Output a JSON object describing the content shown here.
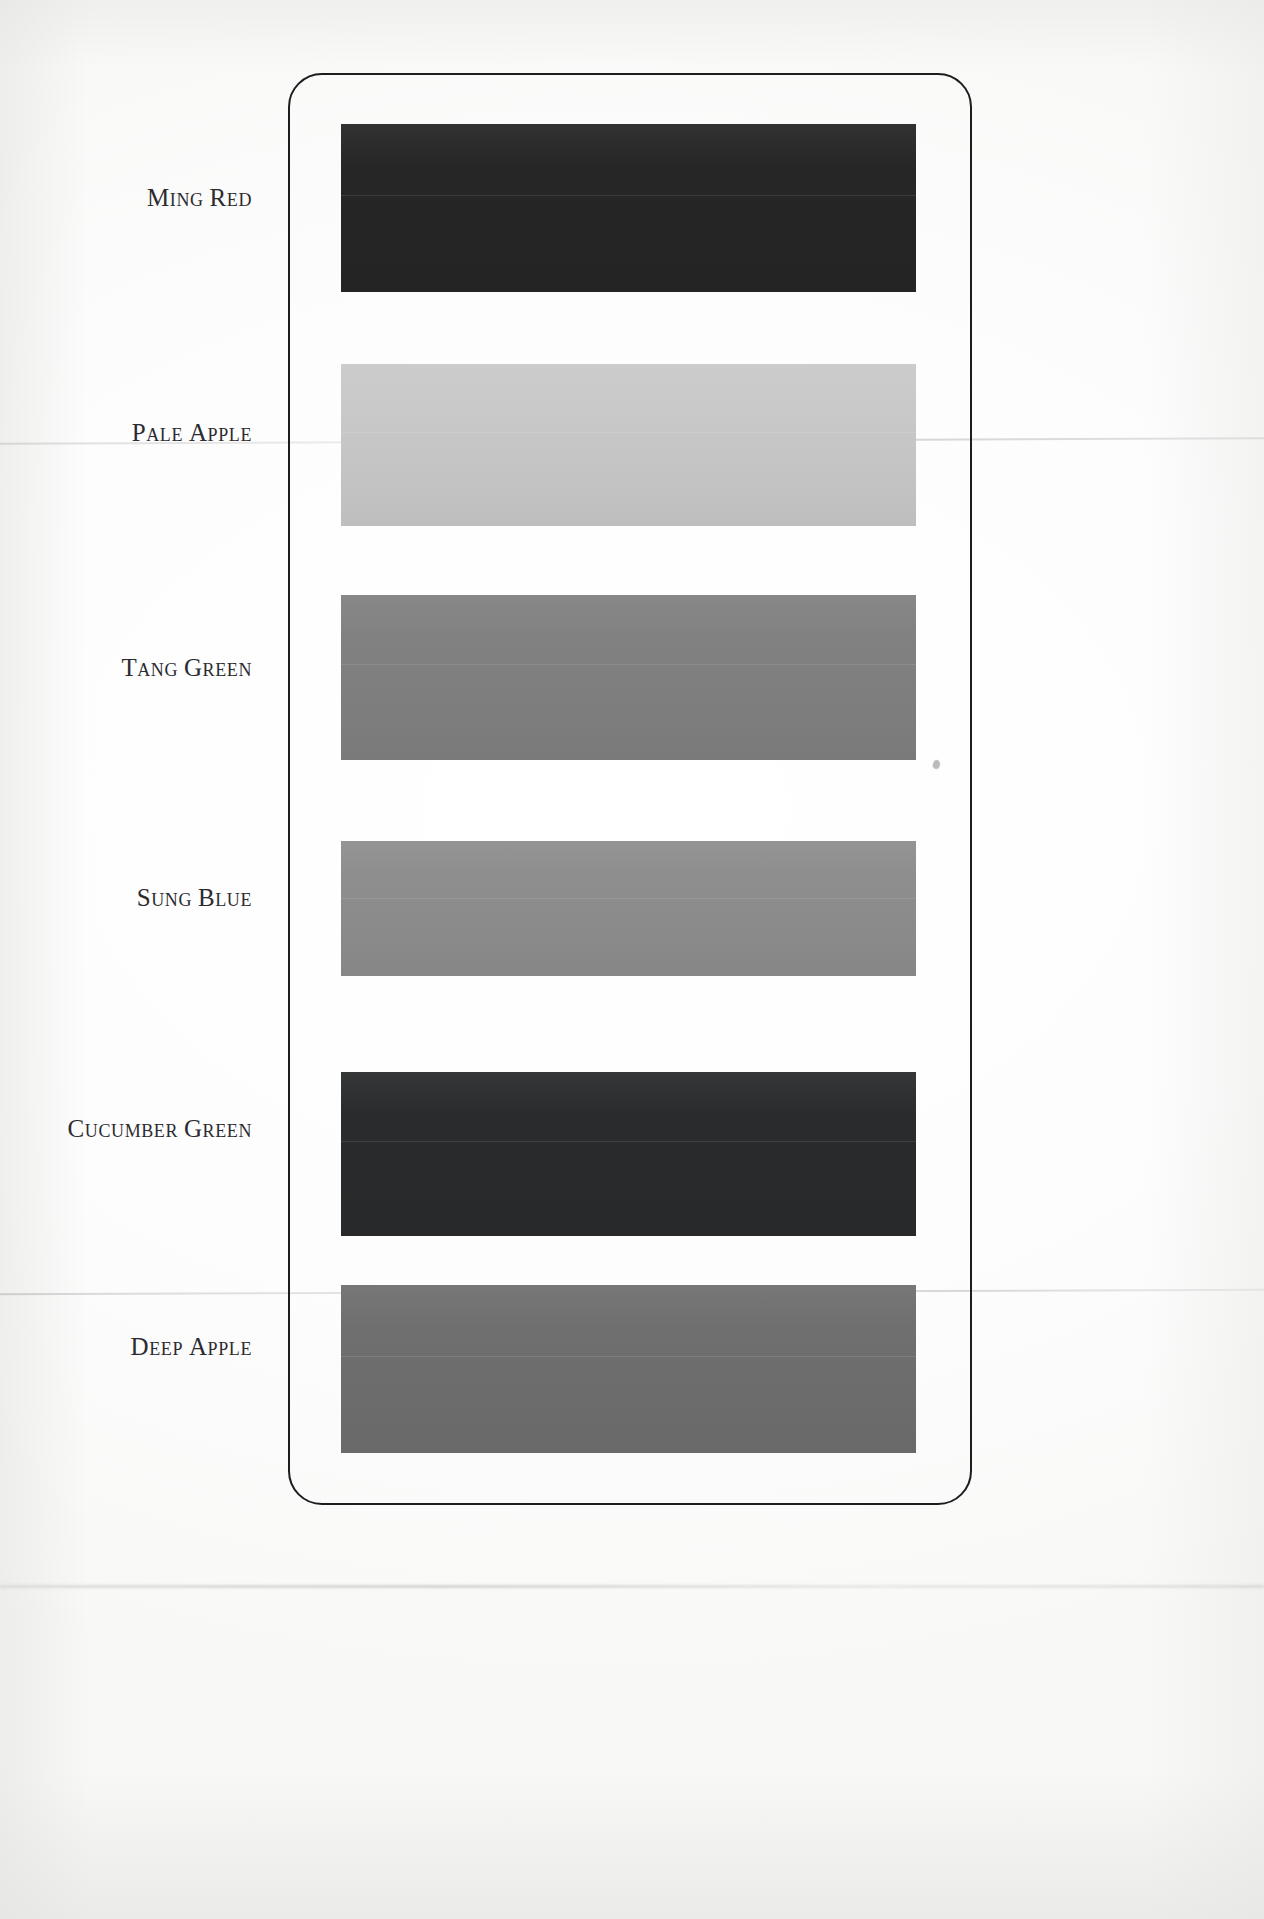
{
  "plate": {
    "frame_color": "#1d1d1d",
    "background_color": "#fdfdfc",
    "rows": [
      {
        "label": "Ming Red",
        "label_first_letter": "M",
        "label_rest": "ing",
        "label_second_word_first": "R",
        "label_second_word_rest": "ed",
        "swatch_color": "#262627",
        "top": 124,
        "height": 168,
        "label_top": 184
      },
      {
        "label": "Pale Apple",
        "label_first_letter": "P",
        "label_rest": "ale",
        "label_second_word_first": "A",
        "label_second_word_rest": "pple",
        "swatch_color": "#c9c9c9",
        "top": 364,
        "height": 162,
        "label_top": 419
      },
      {
        "label": "Tang Green",
        "label_first_letter": "T",
        "label_rest": "ang",
        "label_second_word_first": "G",
        "label_second_word_rest": "reen",
        "swatch_color": "#818181",
        "top": 595,
        "height": 165,
        "label_top": 654
      },
      {
        "label": "Sung Blue",
        "label_first_letter": "S",
        "label_rest": "ung",
        "label_second_word_first": "B",
        "label_second_word_rest": "lue",
        "swatch_color": "#8e8e8e",
        "top": 841,
        "height": 135,
        "label_top": 884
      },
      {
        "label": "Cucumber Green",
        "label_first_letter": "C",
        "label_rest": "ucumber",
        "label_second_word_first": "G",
        "label_second_word_rest": "reen",
        "swatch_color": "#2a2b2c",
        "top": 1072,
        "height": 164,
        "label_top": 1115
      },
      {
        "label": "Deep Apple",
        "label_first_letter": "D",
        "label_rest": "eep",
        "label_second_word_first": "A",
        "label_second_word_rest": "pple",
        "swatch_color": "#6f6f6f",
        "top": 1285,
        "height": 168,
        "label_top": 1333
      }
    ]
  }
}
